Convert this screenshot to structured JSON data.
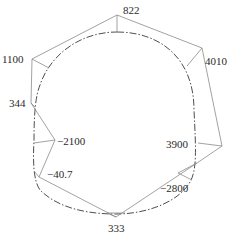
{
  "diagram": {
    "type": "moment-distribution-around-tunnel-section",
    "colors": {
      "outline": "#8a8a8a",
      "section": "#3a3a3a",
      "text": "#2a2a2a"
    },
    "labels": [
      {
        "id": "top",
        "text": "822",
        "x": 123,
        "y": 14
      },
      {
        "id": "right-upper",
        "text": "4010",
        "x": 205,
        "y": 65
      },
      {
        "id": "left-upper",
        "text": "1100",
        "x": 2,
        "y": 63
      },
      {
        "id": "left-mid",
        "text": "344",
        "x": 9,
        "y": 107
      },
      {
        "id": "left-waist",
        "text": "−2100",
        "x": 57,
        "y": 145
      },
      {
        "id": "right-waist",
        "text": "3900",
        "x": 166,
        "y": 148
      },
      {
        "id": "left-lower",
        "text": "−40.7",
        "x": 47,
        "y": 178
      },
      {
        "id": "right-lower",
        "text": "−2800",
        "x": 160,
        "y": 192
      },
      {
        "id": "bottom",
        "text": "333",
        "x": 108,
        "y": 232
      }
    ],
    "outline_points": "117,15 202,48 222,146 197,163 116,217 39,177 55,140 31,103 32,59 117,15",
    "ticks": [
      "117,15 117,32",
      "202,48 187,66",
      "222,146 198,143",
      "197,163 178,173 192,180",
      "116,217 107,213 125,213",
      "39,177 34,171",
      "55,140 34,143",
      "31,103 35,107",
      "32,59 49,68"
    ],
    "section_path": "M117,32 C160,32 194,58 194,110 C196,150 197,170 190,182 C180,200 150,214 116,214 C80,214 55,205 40,190 C33,180 33,160 34,140 C34,110 36,95 40,85 C50,55 80,32 117,32 Z"
  }
}
